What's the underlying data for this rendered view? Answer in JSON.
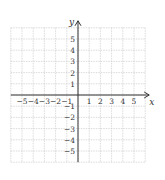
{
  "diagram": {
    "type": "coordinate-plane",
    "axes": {
      "x_label": "x",
      "y_label": "y",
      "x_ticks": [
        "-5",
        "-4",
        "-3",
        "-2",
        "-1",
        "1",
        "2",
        "3",
        "4",
        "5"
      ],
      "y_ticks_positive": [
        "5",
        "4",
        "3",
        "2",
        "1"
      ],
      "y_ticks_negative": [
        "-1",
        "-2",
        "-3",
        "-4",
        "-5"
      ],
      "x_range": [
        -6,
        6
      ],
      "y_range": [
        -6,
        6
      ]
    },
    "grid": {
      "visible": true,
      "step": 1,
      "color": "#cccccc"
    },
    "axis_color": "#333333"
  }
}
